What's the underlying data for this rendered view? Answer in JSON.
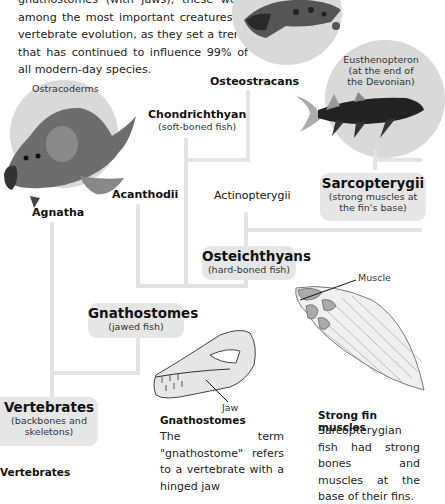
{
  "intro": {
    "text": "gnathostomes (with jaws); these were among the most important creatures in vertebrate evolution, as they set a trend that has continued to influence 99% of all modern-day species."
  },
  "tree": {
    "osteostracans": "Osteostracans",
    "ostracoderms": "Ostracoderms",
    "eusthenopteron": "Eusthenopteron (at the end of the Devonian)",
    "chondrichthyan": {
      "title": "Chondrichthyan",
      "sub": "(soft-boned fish)"
    },
    "acanthodii": "Acanthodii",
    "agnatha": "Agnatha",
    "actinopterygii": "Actinopterygii",
    "sarcopterygii": {
      "title": "Sarcopterygii",
      "sub1": "(strong muscles at",
      "sub2": "the fin's base)"
    },
    "osteichthyans": {
      "title": "Osteichthyans",
      "sub": "(hard-boned fish)"
    },
    "gnathostomes": {
      "title": "Gnathostomes",
      "sub": "(jawed fish)"
    },
    "vertebrates": {
      "title": "Vertebrates",
      "sub1": "(backbones and",
      "sub2": "skeletons)"
    }
  },
  "illustrations": {
    "muscle_label": "Muscle",
    "jaw_label": "Jaw"
  },
  "captions": {
    "gnathostomes": {
      "title": "Gnathostomes",
      "text": "The term \"gnathostome\" refers to a vertebrate with a hinged jaw"
    },
    "fin": {
      "title": "Strong fin muscles",
      "text": "Sarcopterygian fish had strong bones and muscles at the base of their fins."
    },
    "vertebrates": {
      "title": "Vertebrates"
    }
  },
  "colors": {
    "line": "#e3e3e3",
    "box": "#e6e6e6",
    "circle": "#d9d9d9"
  }
}
